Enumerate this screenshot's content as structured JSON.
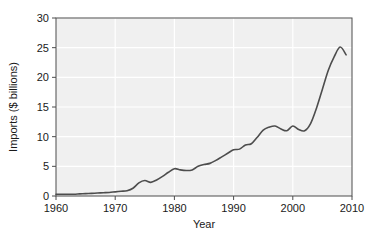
{
  "chart_data": {
    "type": "line",
    "title": "",
    "xlabel": "Year",
    "ylabel": "Imports ($ billions)",
    "xlim": [
      1960,
      2010
    ],
    "ylim": [
      0,
      30
    ],
    "xticks": [
      1960,
      1970,
      1980,
      1990,
      2000,
      2010
    ],
    "yticks": [
      0,
      5,
      10,
      15,
      20,
      25,
      30
    ],
    "xtick_labels": [
      "1960",
      "1970",
      "1980",
      "1990",
      "2000",
      "2010"
    ],
    "ytick_labels": [
      "0",
      "5",
      "10",
      "15",
      "20",
      "25",
      "30"
    ],
    "grid": true,
    "legend": "none",
    "series": [
      {
        "name": "Imports",
        "color": "#4d4d4d",
        "x": [
          1960,
          1961,
          1962,
          1963,
          1964,
          1965,
          1966,
          1967,
          1968,
          1969,
          1970,
          1971,
          1972,
          1973,
          1974,
          1975,
          1976,
          1977,
          1978,
          1979,
          1980,
          1981,
          1982,
          1983,
          1984,
          1985,
          1986,
          1987,
          1988,
          1989,
          1990,
          1991,
          1992,
          1993,
          1994,
          1995,
          1996,
          1997,
          1998,
          1999,
          2000,
          2001,
          2002,
          2003,
          2004,
          2005,
          2006,
          2007,
          2008,
          2009
        ],
        "y": [
          0.3,
          0.3,
          0.3,
          0.3,
          0.35,
          0.4,
          0.45,
          0.5,
          0.55,
          0.6,
          0.7,
          0.8,
          0.9,
          1.3,
          2.2,
          2.6,
          2.3,
          2.7,
          3.3,
          4.0,
          4.6,
          4.4,
          4.3,
          4.4,
          5.0,
          5.3,
          5.5,
          6.0,
          6.6,
          7.2,
          7.8,
          7.9,
          8.6,
          8.8,
          9.9,
          11.1,
          11.6,
          11.8,
          11.3,
          11.0,
          11.8,
          11.2,
          11.0,
          12.2,
          14.8,
          18.0,
          21.2,
          23.5,
          25.1,
          23.8
        ]
      }
    ]
  },
  "axis": {
    "y_label": "Imports ($ billions)",
    "x_label": "Year"
  },
  "colors": {
    "line": "#4d4d4d",
    "plot_background": "#f0f0f0",
    "gridline": "#ffffff",
    "axis": "#4d4d4d",
    "text": "#1a1a1a"
  }
}
